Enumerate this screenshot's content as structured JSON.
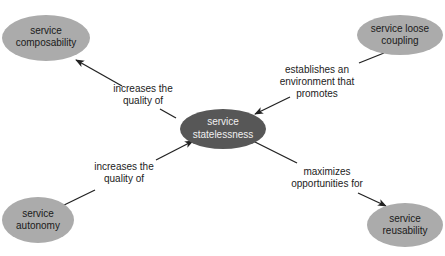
{
  "colors": {
    "background": "#ffffff",
    "center_node_fill": "#575757",
    "center_node_text": "#f0f0f0",
    "outer_node_fill": "#ababab",
    "outer_node_text": "#1a1a1a",
    "edge": "#222222"
  },
  "nodes": {
    "center": {
      "line1": "service",
      "line2": "statelessness"
    },
    "composability": {
      "line1": "service",
      "line2": "composability"
    },
    "loose_coupling": {
      "line1": "service loose",
      "line2": "coupling"
    },
    "autonomy": {
      "line1": "service",
      "line2": "autonomy"
    },
    "reusability": {
      "line1": "service",
      "line2": "reusability"
    }
  },
  "edges": {
    "to_composability": {
      "line1": "increases the",
      "line2": "quality of"
    },
    "from_loose_coupling": {
      "line1": "establishes an",
      "line2": "environment that",
      "line3": "promotes"
    },
    "from_autonomy": {
      "line1": "increases the",
      "line2": "quality of"
    },
    "to_reusability": {
      "line1": "maximizes",
      "line2": "opportunities for"
    }
  }
}
